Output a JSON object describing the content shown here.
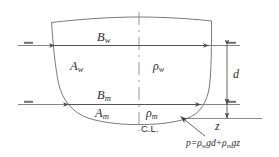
{
  "diagram": {
    "colors": {
      "line": "#5a5a5a",
      "hull": "#6b6b6b",
      "text": "#2b2b2b",
      "background": "#ffffff"
    },
    "labels": {
      "beam_waterline": "B",
      "beam_waterline_sub": "w",
      "beam_midship": "B",
      "beam_midship_sub": "m",
      "area_waterline": "A",
      "area_waterline_sub": "w",
      "area_midship": "A",
      "area_midship_sub": "m",
      "density_water": "ρ",
      "density_water_sub": "w",
      "density_mud": "ρ",
      "density_mud_sub": "m",
      "draft": "d",
      "depth_z": "z",
      "centerline": "C.L."
    },
    "formula": {
      "lhs": "p",
      "equals": "=",
      "term1_rho": "ρ",
      "term1_sub": "w",
      "term1_rest": "gd",
      "plus": "+",
      "term2_rho": "ρ",
      "term2_sub": "m",
      "term2_rest": "gz"
    }
  }
}
